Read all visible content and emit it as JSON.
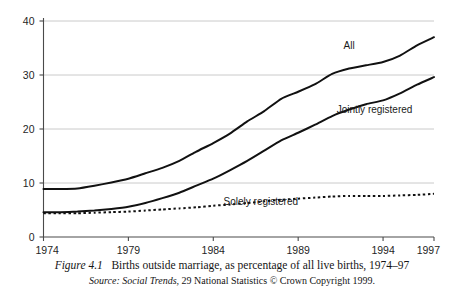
{
  "caption": {
    "figure_label": "Figure 4.1",
    "figure_text": "Births outside marriage, as percentage of all live births, 1974–97",
    "source_label": "Source:",
    "source_title": "Social Trends,",
    "source_rest": "29 National Statistics © Crown Copyright 1999."
  },
  "series_labels": {
    "all": "All",
    "jointly": "Jointly registered",
    "solely": "Solely registered"
  },
  "colors": {
    "line": "#111111",
    "grid": "#bdbdbd",
    "axis": "#4a4a4a",
    "background": "#ffffff"
  },
  "chart_data": {
    "type": "line",
    "title": "Births outside marriage, as percentage of all live births, 1974–97",
    "xlabel": "",
    "ylabel": "",
    "xlim": [
      1974,
      1997
    ],
    "ylim": [
      0,
      40
    ],
    "yticks": [
      0,
      10,
      20,
      30,
      40
    ],
    "ytick_labels": [
      "0",
      "10",
      "20",
      "30",
      "40"
    ],
    "xticks": [
      1974,
      1979,
      1984,
      1989,
      1994,
      1997
    ],
    "xtick_labels": [
      "1974",
      "1979",
      "1984",
      "1989",
      "1994",
      "1997"
    ],
    "grid": true,
    "legend": "inline-annotations",
    "x": [
      1974,
      1975,
      1976,
      1977,
      1978,
      1979,
      1980,
      1981,
      1982,
      1983,
      1984,
      1985,
      1986,
      1987,
      1988,
      1989,
      1990,
      1991,
      1992,
      1993,
      1994,
      1995,
      1996,
      1997
    ],
    "series": [
      {
        "name": "All",
        "style": "solid",
        "values": [
          8.9,
          8.9,
          9.0,
          9.5,
          10.1,
          10.8,
          11.8,
          12.8,
          14.1,
          15.8,
          17.4,
          19.2,
          21.4,
          23.3,
          25.6,
          26.9,
          28.3,
          30.2,
          31.2,
          31.8,
          32.4,
          33.6,
          35.5,
          37.0
        ]
      },
      {
        "name": "Jointly registered",
        "style": "solid",
        "values": [
          4.6,
          4.6,
          4.7,
          4.9,
          5.2,
          5.6,
          6.3,
          7.2,
          8.2,
          9.5,
          10.8,
          12.4,
          14.1,
          16.0,
          17.9,
          19.3,
          20.8,
          22.4,
          23.6,
          24.6,
          25.3,
          26.6,
          28.2,
          29.6
        ]
      },
      {
        "name": "Solely registered",
        "style": "dotted",
        "values": [
          4.4,
          4.4,
          4.4,
          4.5,
          4.6,
          4.7,
          4.9,
          5.1,
          5.3,
          5.5,
          5.8,
          6.0,
          6.3,
          6.6,
          6.9,
          7.1,
          7.3,
          7.5,
          7.6,
          7.6,
          7.6,
          7.7,
          7.8,
          8.0
        ]
      }
    ],
    "annotations": [
      {
        "text": "All",
        "x": 1992.0,
        "y": 34.9
      },
      {
        "text": "Jointly registered",
        "x": 1993.5,
        "y": 23.0
      },
      {
        "text": "Solely registered",
        "x": 1986.8,
        "y": 6.0
      }
    ]
  }
}
